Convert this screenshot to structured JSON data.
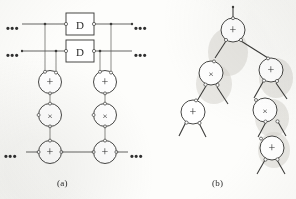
{
  "figure": {
    "background_color": "#fdfdfb",
    "ink_color": "#3a3a3a",
    "shadow_color": "#c9c7c2",
    "captions": {
      "a": "(a)",
      "b": "(b)"
    }
  },
  "panel_a": {
    "name": "systolic-array-panel",
    "ellipsis_label": "•••",
    "ellipses": [
      {
        "id": "left-top",
        "text": "•••"
      },
      {
        "id": "left-middle",
        "text": "•••"
      },
      {
        "id": "right-top",
        "text": "•••"
      },
      {
        "id": "right-middle",
        "text": "•••"
      },
      {
        "id": "left-bottom",
        "text": "•••"
      },
      {
        "id": "right-bottom",
        "text": "•••"
      }
    ],
    "delay_blocks": [
      {
        "id": "delay-upper",
        "label": "D"
      },
      {
        "id": "delay-lower",
        "label": "D"
      }
    ],
    "nodes": [
      {
        "id": "adder-left-upper",
        "op": "+",
        "column": "left",
        "row": "upper"
      },
      {
        "id": "adder-right-upper",
        "op": "+",
        "column": "right",
        "row": "upper"
      },
      {
        "id": "multiplier-left",
        "op": "×",
        "column": "left",
        "row": "middle"
      },
      {
        "id": "multiplier-right",
        "op": "×",
        "column": "right",
        "row": "middle"
      },
      {
        "id": "adder-left-lower",
        "op": "+",
        "column": "left",
        "row": "lower"
      },
      {
        "id": "adder-right-lower",
        "op": "+",
        "column": "right",
        "row": "lower"
      }
    ]
  },
  "panel_b": {
    "name": "operation-tree-panel",
    "nodes": [
      {
        "id": "tree-root",
        "op": "+",
        "level": 0
      },
      {
        "id": "tree-left-mul",
        "op": "×",
        "level": 1
      },
      {
        "id": "tree-right-add",
        "op": "+",
        "level": 1
      },
      {
        "id": "tree-leftleft-add",
        "op": "+",
        "level": 2
      },
      {
        "id": "tree-rightleft-mul",
        "op": "×",
        "level": 2
      },
      {
        "id": "tree-rightright-add",
        "op": "+",
        "level": 3
      }
    ]
  }
}
